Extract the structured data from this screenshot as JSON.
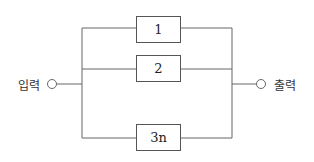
{
  "diagram": {
    "input_label": "입력",
    "output_label": "출력",
    "blocks": [
      {
        "label": "1"
      },
      {
        "label": "2"
      },
      {
        "label": "3n"
      }
    ]
  }
}
